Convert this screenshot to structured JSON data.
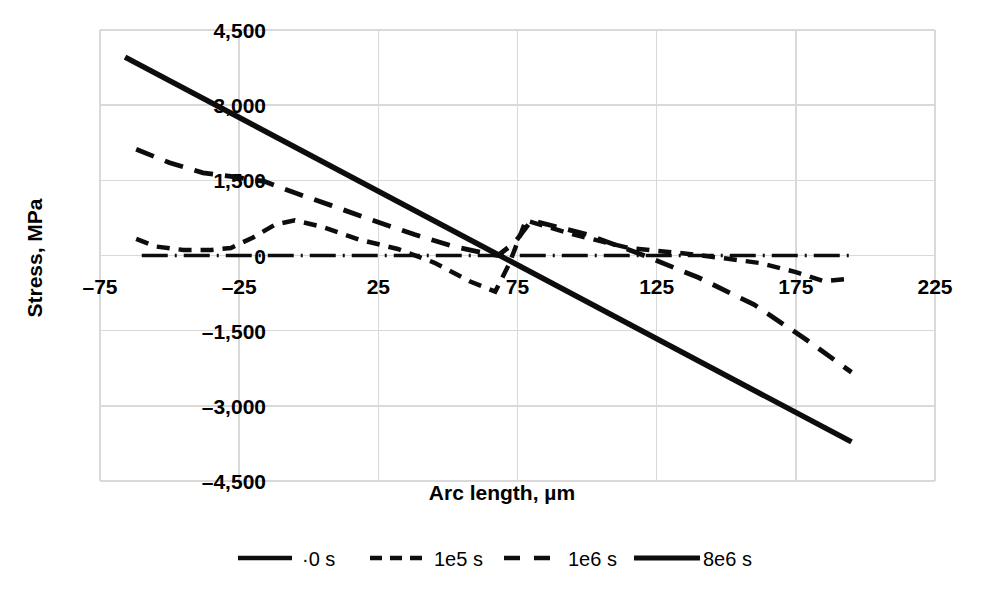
{
  "chart_data": {
    "type": "line",
    "title": "",
    "xlabel": "Arc length, µm",
    "ylabel": "Stress, MPa",
    "xlim": [
      -75,
      225
    ],
    "ylim": [
      -4500,
      4500
    ],
    "xticks": [
      -75,
      -25,
      25,
      75,
      125,
      175,
      225
    ],
    "xtick_labels": [
      "–75",
      "–25",
      "25",
      "75",
      "125",
      "175",
      "225"
    ],
    "yticks": [
      4500,
      3000,
      1500,
      0,
      -1500,
      -3000,
      -4500
    ],
    "ytick_labels": [
      "4,500",
      "3,000",
      "1,500",
      "0",
      "–1,500",
      "–3,000",
      "–4,500"
    ],
    "grid": true,
    "legend_position": "bottom",
    "series": [
      {
        "name": "0 s",
        "legend_label": "·0 s",
        "style": "dash-dot",
        "width": 3.5,
        "color": "#0d0d0d",
        "x": [
          -60,
          -40,
          -20,
          0,
          20,
          40,
          60,
          80,
          100,
          120,
          140,
          160,
          180,
          195
        ],
        "values": [
          0,
          0,
          0,
          0,
          0,
          0,
          0,
          0,
          0,
          0,
          0,
          0,
          0,
          0
        ]
      },
      {
        "name": "1e5 s",
        "legend_label": "1e5 s",
        "style": "dashed-short",
        "width": 4.5,
        "color": "#0d0d0d",
        "x": [
          -62,
          -55,
          -45,
          -35,
          -28,
          -20,
          -12,
          -5,
          5,
          18,
          32,
          45,
          58,
          67,
          72,
          78,
          95,
          115,
          135,
          150,
          162,
          175,
          185,
          195
        ],
        "values": [
          330,
          180,
          110,
          110,
          150,
          360,
          620,
          700,
          570,
          320,
          130,
          -140,
          -520,
          -720,
          -170,
          700,
          420,
          150,
          40,
          -60,
          -150,
          -330,
          -510,
          -460
        ]
      },
      {
        "name": "1e6 s",
        "legend_label": "1e6 s",
        "style": "dashed-long",
        "width": 4.8,
        "color": "#0d0d0d",
        "x": [
          -62,
          -50,
          -38,
          -28,
          -16,
          -5,
          8,
          22,
          38,
          52,
          62,
          68,
          74,
          80,
          100,
          120,
          140,
          160,
          178,
          195
        ],
        "values": [
          2120,
          1850,
          1650,
          1580,
          1480,
          1250,
          1000,
          720,
          420,
          180,
          60,
          0,
          260,
          700,
          420,
          10,
          -440,
          -980,
          -1650,
          -2330
        ]
      },
      {
        "name": "8e6 s",
        "legend_label": "8e6 s",
        "style": "solid",
        "width": 5.5,
        "color": "#0d0d0d",
        "x": [
          -66,
          195
        ],
        "values": [
          3960,
          -3720
        ]
      }
    ]
  },
  "legend": {
    "items": [
      {
        "label": "·0 s",
        "style": "dash-dot"
      },
      {
        "label": "1e5 s",
        "style": "dashed-short"
      },
      {
        "label": "1e6 s",
        "style": "dashed-long"
      },
      {
        "label": "8e6 s",
        "style": "solid"
      }
    ]
  }
}
